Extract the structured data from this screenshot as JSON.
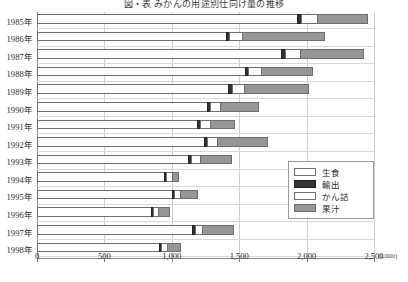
{
  "chart_data": {
    "type": "bar",
    "orientation": "horizontal",
    "stacked": true,
    "title": "図・表  みかんの用途別仕向け量の推移",
    "xlabel": "",
    "ylabel": "",
    "x_unit": "(1,000t)",
    "xlim": [
      0,
      2500
    ],
    "grid": true,
    "legend_position": "right-middle",
    "categories": [
      "1985年",
      "1986年",
      "1987年",
      "1988年",
      "1989年",
      "1990年",
      "1991年",
      "1992年",
      "1993年",
      "1994年",
      "1995年",
      "1996年",
      "1997年",
      "1998年"
    ],
    "tick_values": [
      0,
      500,
      1000,
      1500,
      2000,
      2500
    ],
    "tick_labels": [
      "0",
      "500",
      "1,000",
      "1,500",
      "2,000",
      "2,500"
    ],
    "series": [
      {
        "name": "生食",
        "color": "#ffffff",
        "values": [
          1930,
          1400,
          1810,
          1540,
          1420,
          1260,
          1190,
          1240,
          1120,
          940,
          1000,
          845,
          1150,
          905
        ]
      },
      {
        "name": "輸出",
        "color": "#333333",
        "values": [
          30,
          28,
          30,
          28,
          27,
          24,
          22,
          24,
          22,
          18,
          18,
          15,
          20,
          17
        ]
      },
      {
        "name": "かん詰",
        "color": "#ffffff",
        "values": [
          115,
          92,
          108,
          92,
          88,
          76,
          70,
          72,
          66,
          44,
          42,
          36,
          55,
          40
        ]
      },
      {
        "name": "果汁",
        "color": "#969696",
        "values": [
          380,
          620,
          475,
          390,
          485,
          290,
          185,
          380,
          240,
          55,
          135,
          90,
          235,
          105
        ]
      }
    ]
  },
  "legend": {
    "items": [
      {
        "label": "生食",
        "key": "fresh"
      },
      {
        "label": "輸出",
        "key": "export"
      },
      {
        "label": "かん詰",
        "key": "canned"
      },
      {
        "label": "果汁",
        "key": "juice"
      }
    ]
  }
}
